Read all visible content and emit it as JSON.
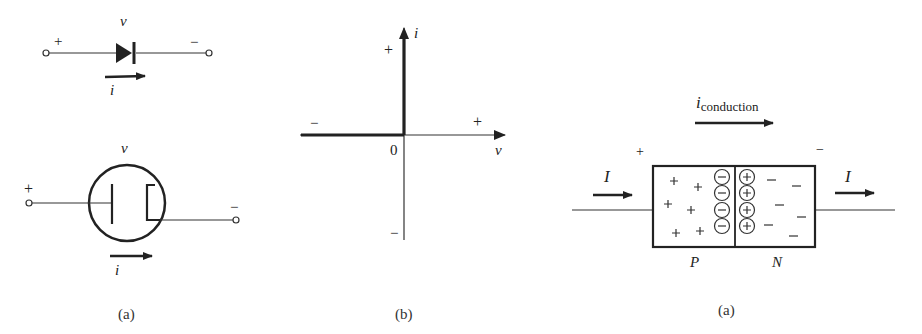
{
  "figures": {
    "diode_symbol": {
      "voltage_label": "v",
      "current_label": "i",
      "plus_sign": "+",
      "minus_sign": "−"
    },
    "vacuum_tube": {
      "voltage_label": "v",
      "current_label": "i",
      "plus_sign": "+",
      "minus_sign": "−",
      "caption": "(a)"
    },
    "iv_characteristic": {
      "y_axis_label": "i",
      "x_axis_label": "v",
      "origin_label": "0",
      "y_plus": "+",
      "y_minus": "−",
      "x_plus": "+",
      "x_minus": "−",
      "caption": "(b)"
    },
    "pn_junction": {
      "conduction_label_main": "i",
      "conduction_label_sub": "conduction",
      "left_current_label": "I",
      "right_current_label": "I",
      "plus_sign": "+",
      "minus_sign": "−",
      "p_region_label": "P",
      "n_region_label": "N",
      "depletion_negative_ion": "−",
      "depletion_positive_ion": "+",
      "caption": "(a)"
    }
  }
}
